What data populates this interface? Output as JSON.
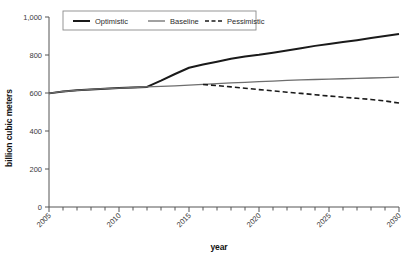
{
  "chart_data": {
    "type": "line",
    "title": "",
    "xlabel": "year",
    "ylabel": "billion cubic meters",
    "xlim": [
      2005,
      2030
    ],
    "ylim": [
      0,
      1000
    ],
    "grid": false,
    "legend_position": "top-left-inside",
    "x": [
      2005,
      2006,
      2007,
      2008,
      2009,
      2010,
      2011,
      2012,
      2013,
      2014,
      2015,
      2016,
      2017,
      2018,
      2019,
      2020,
      2021,
      2022,
      2023,
      2024,
      2025,
      2026,
      2027,
      2028,
      2029,
      2030
    ],
    "y_tick_labels": [
      "0",
      "200",
      "400",
      "600",
      "800",
      "1,000"
    ],
    "y_tick_values": [
      0,
      200,
      400,
      600,
      800,
      1000
    ],
    "x_tick_values": [
      2005,
      2006,
      2007,
      2008,
      2009,
      2010,
      2011,
      2012,
      2013,
      2014,
      2015,
      2016,
      2017,
      2018,
      2019,
      2020,
      2021,
      2022,
      2023,
      2024,
      2025,
      2026,
      2027,
      2028,
      2029,
      2030
    ],
    "x_tick_labels": [
      "2005",
      "",
      "",
      "",
      "",
      "2010",
      "",
      "",
      "",
      "",
      "2015",
      "",
      "",
      "",
      "",
      "2020",
      "",
      "",
      "",
      "",
      "2025",
      "",
      "",
      "",
      "",
      "2030"
    ],
    "x_tick_label_rotation": -45,
    "series": [
      {
        "name": "Optimistic",
        "style": "solid",
        "color": "#1a1a1a",
        "width": 2.0,
        "values": [
          598,
          608,
          614,
          619,
          623,
          626,
          629,
          632,
          665,
          700,
          733,
          750,
          765,
          780,
          792,
          801,
          812,
          824,
          836,
          848,
          858,
          868,
          878,
          889,
          900,
          910
        ]
      },
      {
        "name": "Baseline",
        "style": "solid",
        "color": "#6e6e6e",
        "width": 1.3,
        "values": [
          598,
          608,
          614,
          619,
          623,
          626,
          629,
          632,
          635,
          638,
          641,
          645,
          649,
          653,
          656,
          660,
          663,
          666,
          669,
          671,
          673,
          675,
          677,
          679,
          681,
          684
        ]
      },
      {
        "name": "Pessimistic",
        "style": "dashed",
        "color": "#1a1a1a",
        "width": 1.6,
        "start_index": 11,
        "values": [
          null,
          null,
          null,
          null,
          null,
          null,
          null,
          null,
          null,
          null,
          null,
          645,
          639,
          632,
          625,
          618,
          611,
          604,
          598,
          591,
          584,
          578,
          572,
          566,
          558,
          547
        ]
      }
    ]
  },
  "legend": {
    "entries": [
      {
        "label": "Optimistic"
      },
      {
        "label": "Baseline"
      },
      {
        "label": "Pessimistic"
      }
    ]
  },
  "axes": {
    "x_title": "year",
    "y_title": "billion cubic meters"
  }
}
